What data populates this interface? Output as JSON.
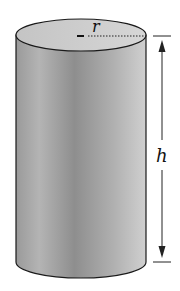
{
  "diagram": {
    "labels": {
      "radius": "r",
      "height": "h"
    },
    "colors": {
      "body_light": "#d8d8d8",
      "body_dark": "#8a8a8a",
      "top_face": "#c8c8c8",
      "stroke": "#1a1a1a"
    }
  }
}
